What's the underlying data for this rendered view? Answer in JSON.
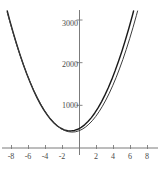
{
  "figure": {
    "background_color": "#ffffff",
    "axis_color": "#7b7b7b",
    "label_color": "#4a4a4a"
  },
  "chart_data": {
    "type": "line",
    "title": "",
    "subtitle": "",
    "xlabel": "",
    "ylabel": "",
    "xlim": [
      -8.8,
      8.8
    ],
    "ylim": [
      0,
      3300
    ],
    "grid": false,
    "legend": "none",
    "axes_style": "centered-cross",
    "x_ticks": [
      -8,
      -6,
      -4,
      -2,
      2,
      4,
      6,
      8
    ],
    "x_tick_labels": [
      "-8",
      "-6",
      "-4",
      "-2",
      "2",
      "4",
      "6",
      "8"
    ],
    "y_ticks": [
      1000,
      2000,
      3000
    ],
    "y_tick_labels": [
      "1000",
      "2000",
      "3000"
    ],
    "series": [
      {
        "name": "curve-a",
        "color": "#1a1a1a",
        "width": 1.4,
        "x": [
          -8.6,
          -8.2,
          -7.8,
          -7.4,
          -7.0,
          -6.6,
          -6.2,
          -5.8,
          -5.4,
          -5.0,
          -4.6,
          -4.2,
          -3.8,
          -3.4,
          -3.0,
          -2.6,
          -2.2,
          -1.8,
          -1.4,
          -1.0,
          -0.6,
          -0.2,
          0.2,
          0.6,
          1.0,
          1.4,
          1.8,
          2.2,
          2.6,
          3.0,
          3.4,
          3.8,
          4.2,
          4.6,
          5.0,
          5.4,
          5.8,
          6.2,
          6.6,
          7.0,
          7.4,
          7.8
        ],
        "y": [
          3285,
          2986,
          2703,
          2436,
          2186,
          1952,
          1735,
          1534,
          1349,
          1181,
          1029,
          894,
          775,
          672,
          586,
          516,
          463,
          425,
          404,
          400,
          411,
          439,
          483,
          543,
          620,
          712,
          821,
          946,
          1087,
          1245,
          1418,
          1608,
          1814,
          2037,
          2275,
          2530,
          2801,
          3088,
          3392,
          3712,
          4049,
          4401
        ]
      },
      {
        "name": "curve-b",
        "color": "#3d3d3d",
        "width": 1.0,
        "x": [
          -8.5,
          -8.1,
          -7.7,
          -7.3,
          -6.9,
          -6.5,
          -6.1,
          -5.7,
          -5.3,
          -4.9,
          -4.5,
          -4.1,
          -3.7,
          -3.3,
          -2.9,
          -2.5,
          -2.1,
          -1.7,
          -1.3,
          -0.9,
          -0.5,
          -0.1,
          0.3,
          0.7,
          1.1,
          1.5,
          1.9,
          2.3,
          2.7,
          3.1,
          3.5,
          3.9,
          4.3,
          4.7,
          5.1,
          5.5,
          5.9,
          6.3,
          6.7,
          7.1,
          7.5,
          7.9,
          8.3
        ],
        "y": [
          3176,
          2890,
          2618,
          2362,
          2122,
          1897,
          1688,
          1494,
          1316,
          1153,
          1005,
          874,
          757,
          656,
          571,
          500,
          446,
          406,
          382,
          373,
          379,
          401,
          437,
          489,
          557,
          639,
          737,
          851,
          980,
          1124,
          1283,
          1458,
          1648,
          1854,
          2074,
          2311,
          2562,
          2829,
          3111,
          3409,
          3722,
          4050,
          4394
        ]
      }
    ]
  },
  "y_axis_labels": [
    {
      "text": "3000",
      "top": 20,
      "right": 78
    },
    {
      "text": "2000",
      "top": 61,
      "right": 78
    },
    {
      "text": "1000",
      "top": 102,
      "right": 78
    }
  ],
  "x_axis_labels": [
    {
      "text": "-8",
      "left": 11
    },
    {
      "text": "-6",
      "left": 28
    },
    {
      "text": "-4",
      "left": 45
    },
    {
      "text": "-2",
      "left": 62
    },
    {
      "text": "2",
      "left": 96
    },
    {
      "text": "4",
      "left": 113
    },
    {
      "text": "6",
      "left": 130
    },
    {
      "text": "8",
      "left": 147
    }
  ]
}
